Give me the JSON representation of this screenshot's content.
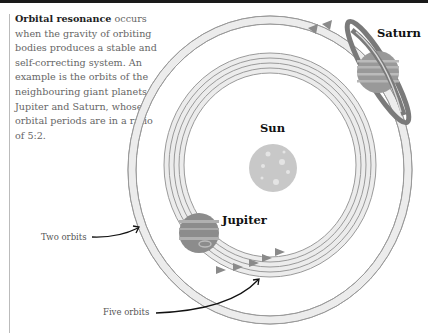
{
  "caption": {
    "title": "Orbital resonance",
    "body": " occurs when the gravity of orbiting bodies produces a stable and self-correcting system. An example is the orbits of the neighbouring giant planets Jupiter and Saturn, whose orbital periods are in a ratio of 5:2."
  },
  "labels": {
    "saturn": "Saturn",
    "sun": "Sun",
    "jupiter": "Jupiter",
    "two_orbits": "Two orbits",
    "five_orbits": "Five orbits"
  },
  "colors": {
    "orbit_fill": "#ececec",
    "orbit_stroke": "#9a9a9a",
    "arrow": "#8a8a8a",
    "sun": "#c8c8c8",
    "planet": "#8c8c8c",
    "text_dark": "#111111",
    "text_gray": "#666666"
  },
  "resonance": {
    "saturn_orbits": 2,
    "jupiter_orbits": 5,
    "ratio": "5:2"
  }
}
